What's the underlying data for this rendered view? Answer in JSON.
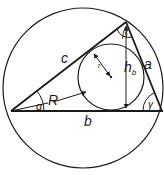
{
  "diagram": {
    "labels": {
      "side_a": "a",
      "side_b": "b",
      "side_c": "c",
      "angle_alpha": "α",
      "angle_beta": "β",
      "angle_gamma": "γ",
      "circumradius": "R",
      "inradius": "r",
      "height": "h",
      "height_subscript": "b"
    },
    "colors": {
      "stroke": "#1a1a1a",
      "background": "#ffffff"
    }
  }
}
